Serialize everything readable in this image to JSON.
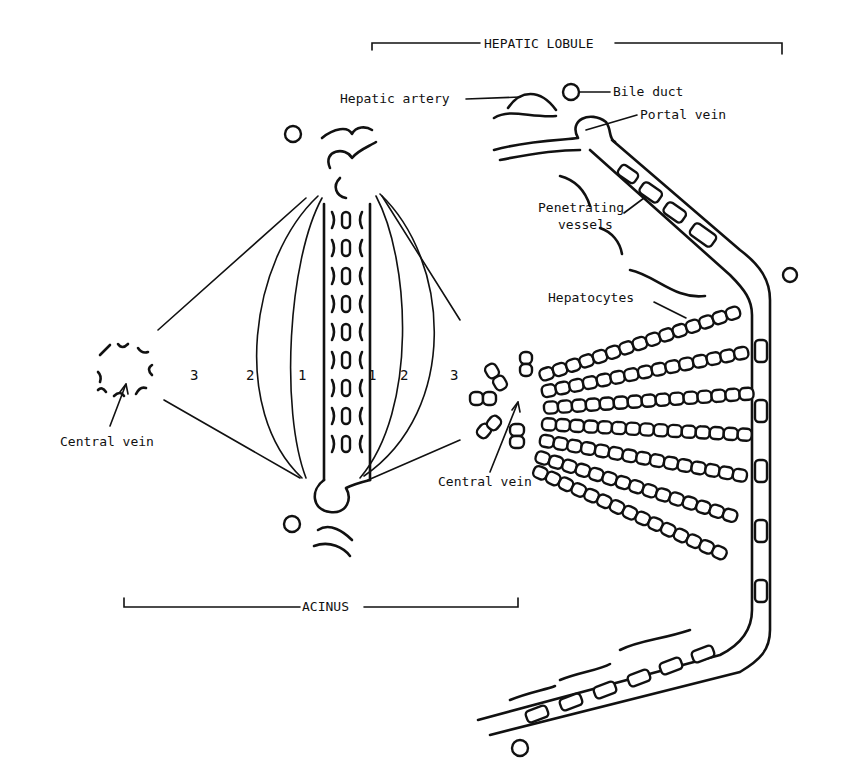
{
  "diagram": {
    "type": "anatomical-illustration",
    "brackets": {
      "hepatic_lobule": "HEPATIC LOBULE",
      "acinus": "ACINUS"
    },
    "labels": {
      "hepatic_artery": "Hepatic artery",
      "bile_duct": "Bile duct",
      "portal_vein": "Portal vein",
      "penetrating_vessels_1": "Penetrating",
      "penetrating_vessels_2": "vessels",
      "hepatocytes": "Hepatocytes",
      "central_vein_left": "Central vein",
      "central_vein_right": "Central vein"
    },
    "zones": {
      "left": [
        "3",
        "2",
        "1"
      ],
      "right": [
        "1",
        "2",
        "3"
      ]
    },
    "colors": {
      "ink": "#111111",
      "background": "#ffffff"
    }
  }
}
